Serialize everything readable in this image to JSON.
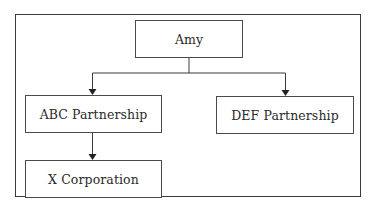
{
  "diagram": {
    "type": "ownership-tree",
    "nodes": {
      "amy": {
        "label": "Amy"
      },
      "abc": {
        "label": "ABC Partnership"
      },
      "def": {
        "label": "DEF Partnership"
      },
      "xcorp": {
        "label": "X Corporation"
      }
    },
    "edges": [
      {
        "from": "Amy",
        "to": "ABC Partnership"
      },
      {
        "from": "Amy",
        "to": "DEF Partnership"
      },
      {
        "from": "ABC Partnership",
        "to": "X Corporation"
      }
    ],
    "colors": {
      "line": "#3a3a3a",
      "text": "#2a2a2a",
      "background": "#ffffff"
    }
  }
}
